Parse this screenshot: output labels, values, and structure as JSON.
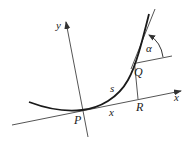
{
  "diagram": {
    "colors": {
      "stroke": "#555555",
      "curve": "#1a1a1a",
      "text": "#222222",
      "background": "#ffffff"
    },
    "labels": {
      "y_axis": "y",
      "x_axis": "x",
      "point_P": "P",
      "point_Q": "Q",
      "point_R": "R",
      "arc_length": "s",
      "segment_x": "x",
      "angle": "α"
    }
  }
}
